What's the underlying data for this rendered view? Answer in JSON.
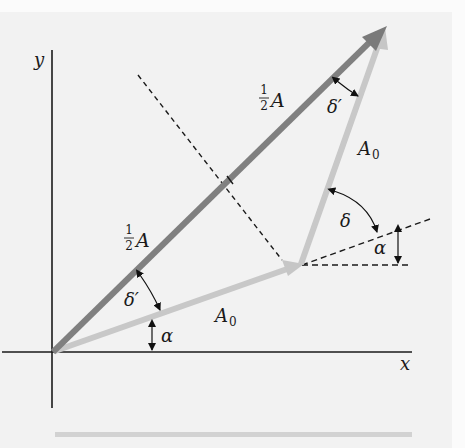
{
  "diagram": {
    "axes": {
      "x_label": "x",
      "y_label": "y"
    },
    "vectors": [
      {
        "name": "half-A-lower",
        "label_num": "1",
        "label_den": "2",
        "label_sym": "A",
        "color": "#808080"
      },
      {
        "name": "half-A-upper",
        "label_num": "1",
        "label_den": "2",
        "label_sym": "A",
        "color": "#808080"
      },
      {
        "name": "A0-first",
        "label_sym": "A",
        "label_sub": "0",
        "color": "#c8c8c8"
      },
      {
        "name": "A0-second",
        "label_sym": "A",
        "label_sub": "0",
        "color": "#c8c8c8"
      }
    ],
    "angles": {
      "alpha_lower": "α",
      "alpha_upper": "α",
      "delta": "δ",
      "delta_prime_lower": "δ′",
      "delta_prime_upper": "δ′"
    },
    "colors": {
      "background": "#f2f2f2",
      "resultant": "#808080",
      "component": "#c8c8c8",
      "axis": "#1a1a1a",
      "dashed": "#1a1a1a"
    }
  }
}
